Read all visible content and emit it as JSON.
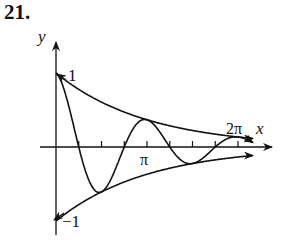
{
  "problem_number": "21.",
  "chart_data": {
    "type": "line",
    "title": "",
    "xlabel": "x",
    "ylabel": "y",
    "x_tick_labels": [
      "π",
      "2π"
    ],
    "x_ticks_count_between": "ticks every π/4 from π/4 to 2π",
    "y_tick_labels": [
      "1",
      "−1"
    ],
    "xlim": [
      0,
      7.0
    ],
    "ylim": [
      -1.05,
      1.25
    ],
    "grid": false,
    "legend": null,
    "series": [
      {
        "name": "upper envelope",
        "formula": "y = e^(-x/π)",
        "start": [
          0,
          1
        ],
        "end_arrow": true
      },
      {
        "name": "lower envelope",
        "formula": "y = -e^(-x/π)",
        "start": [
          0,
          -1
        ],
        "end_arrow": true
      },
      {
        "name": "damped oscillation",
        "formula": "y = e^(-x/π)·cos(2x)",
        "start": [
          0,
          1
        ],
        "zeros": [
          "π/4",
          "3π/4",
          "5π/4",
          "7π/4"
        ],
        "end_arrow": true
      }
    ],
    "sample_points": {
      "x": [
        0,
        0.785,
        1.571,
        2.356,
        3.142,
        3.927,
        4.712,
        5.498,
        6.283
      ],
      "upper": [
        1.0,
        0.779,
        0.607,
        0.472,
        0.368,
        0.287,
        0.223,
        0.174,
        0.135
      ],
      "lower": [
        -1.0,
        -0.779,
        -0.607,
        -0.472,
        -0.368,
        -0.287,
        -0.223,
        -0.174,
        -0.135
      ],
      "oscillation": [
        1.0,
        0.0,
        -0.607,
        0.0,
        0.368,
        0.0,
        -0.223,
        0.0,
        0.135
      ]
    }
  },
  "labels": {
    "x_axis": "x",
    "y_axis": "y",
    "pi": "π",
    "two_pi": "2π",
    "one": "1",
    "minus_one": "−1"
  }
}
